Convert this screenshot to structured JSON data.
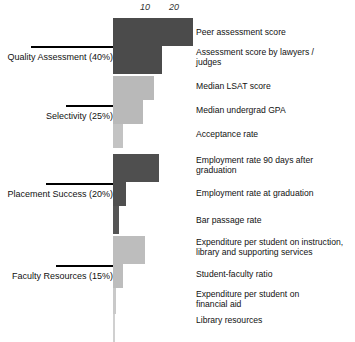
{
  "chart_data": {
    "type": "bar",
    "orientation": "horizontal",
    "title": "",
    "xlabel": "",
    "ylabel": "",
    "xlim": [
      0,
      30
    ],
    "grid": false,
    "legend": "none",
    "ticks": [
      {
        "label": "10",
        "value": 10
      },
      {
        "label": "20",
        "value": 20
      }
    ],
    "categories": [
      "Peer assessment score",
      "Assessment score by lawyers /\njudges",
      "Median LSAT score",
      "Median undergrad GPA",
      "Acceptance rate",
      "Employment rate 90 days after\ngraduation",
      "Employment rate at graduation",
      "Bar passage rate",
      "Expenditure per student on instruction,\nlibrary and supporting services",
      "Student-faculty ratio",
      "Expenditure per student on\nfinancial aid",
      "Library resources"
    ],
    "values": [
      27.5,
      17.0,
      14.0,
      10.5,
      3.5,
      16.0,
      4.5,
      2.0,
      11.0,
      3.5,
      1.0,
      0.75
    ],
    "colors": [
      "#4b4b4b",
      "#4b4b4b",
      "#b9b9b9",
      "#b9b9b9",
      "#c3c3c3",
      "#4f4f4f",
      "#4f4f4f",
      "#555555",
      "#bdbdbd",
      "#bdbdbd",
      "#c9c9c9",
      "#d0d0d0"
    ],
    "groups": [
      {
        "label": "Quality Assessment (40%)",
        "weight": "40%",
        "members": [
          0,
          1
        ]
      },
      {
        "label": "Selectivity (25%)",
        "weight": "25%",
        "members": [
          2,
          3,
          4
        ]
      },
      {
        "label": "Placement Success (20%)",
        "weight": "20%",
        "members": [
          5,
          6,
          7
        ]
      },
      {
        "label": "Faculty Resources (15%)",
        "weight": "15%",
        "members": [
          8,
          9,
          10,
          11
        ]
      }
    ]
  },
  "bars": [
    {
      "label": "Peer assessment score",
      "value": 27.5,
      "color": "#4b4b4b",
      "top": 4,
      "height": 28,
      "label_top": 13
    },
    {
      "label": "Assessment score by lawyers /\njudges",
      "value": 17.0,
      "color": "#4b4b4b",
      "top": 32,
      "height": 28,
      "label_top": 33
    },
    {
      "label": "Median LSAT score",
      "value": 14.0,
      "color": "#b9b9b9",
      "top": 62,
      "height": 24,
      "label_top": 67
    },
    {
      "label": "Median undergrad GPA",
      "value": 10.5,
      "color": "#b9b9b9",
      "top": 86,
      "height": 24,
      "label_top": 91
    },
    {
      "label": "Acceptance rate",
      "value": 3.5,
      "color": "#c3c3c3",
      "top": 110,
      "height": 24,
      "label_top": 115
    },
    {
      "label": "Employment rate 90 days after\ngraduation",
      "value": 16.0,
      "color": "#4f4f4f",
      "top": 140,
      "height": 28,
      "label_top": 141
    },
    {
      "label": "Employment rate at graduation",
      "value": 4.5,
      "color": "#4f4f4f",
      "top": 168,
      "height": 24,
      "label_top": 174
    },
    {
      "label": "Bar passage rate",
      "value": 2.0,
      "color": "#555555",
      "top": 192,
      "height": 28,
      "label_top": 201
    },
    {
      "label": "Expenditure per student on instruction,\nlibrary and supporting services",
      "value": 11.0,
      "color": "#bdbdbd",
      "top": 222,
      "height": 28,
      "label_top": 223
    },
    {
      "label": "Student-faculty ratio",
      "value": 3.5,
      "color": "#bdbdbd",
      "top": 250,
      "height": 24,
      "label_top": 255
    },
    {
      "label": "Expenditure per student on\nfinancial aid",
      "value": 1.0,
      "color": "#c9c9c9",
      "top": 274,
      "height": 26,
      "label_top": 275
    },
    {
      "label": "Library resources",
      "value": 0.75,
      "color": "#d0d0d0",
      "top": 300,
      "height": 28,
      "label_top": 301
    }
  ],
  "groups": [
    {
      "label": "Quality Assessment (40%)",
      "rule_left": 31,
      "rule_width": 82,
      "rule_top": 32,
      "label_top": 38
    },
    {
      "label": "Selectivity (25%)",
      "rule_left": 66,
      "rule_width": 47,
      "rule_top": 91,
      "label_top": 97
    },
    {
      "label": "Placement Success (20%)",
      "rule_left": 46,
      "rule_width": 67,
      "rule_top": 169,
      "label_top": 175
    },
    {
      "label": "Faculty Resources (15%)",
      "rule_left": 56,
      "rule_width": 57,
      "rule_top": 251,
      "label_top": 257
    }
  ],
  "axis": {
    "origin_px": 113,
    "px_per_unit": 2.9,
    "ticks": [
      {
        "label": "10",
        "x": 145
      },
      {
        "label": "20",
        "x": 174
      }
    ]
  }
}
